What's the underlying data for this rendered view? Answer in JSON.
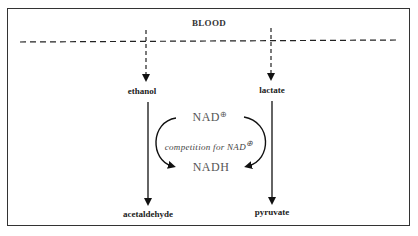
{
  "diagram": {
    "compartment_label": "BLOOD",
    "left_pathway": {
      "substrate": "ethanol",
      "product": "acetaldehyde"
    },
    "right_pathway": {
      "substrate": "lactate",
      "product": "pyruvate"
    },
    "cofactor_top": "NAD",
    "cofactor_top_charge": "⊕",
    "cofactor_bottom": "NADH",
    "competition_label": "competition for NAD",
    "competition_charge": "⊕"
  }
}
